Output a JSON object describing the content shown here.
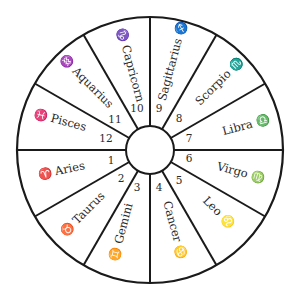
{
  "diagram": {
    "type": "zodiac-wheel",
    "center": [
      150,
      150
    ],
    "outer_radius": 133,
    "inner_radius": 24,
    "sector_count": 12,
    "line_color": "#1a1a1a",
    "text_color": "#2a2a2a",
    "sectors": [
      {
        "house": "1",
        "sign": "Aries",
        "symbol": "♈",
        "mid_angle": 165
      },
      {
        "house": "2",
        "sign": "Taurus",
        "symbol": "♉",
        "mid_angle": 135
      },
      {
        "house": "3",
        "sign": "Gemini",
        "symbol": "♊",
        "mid_angle": 105
      },
      {
        "house": "4",
        "sign": "Cancer",
        "symbol": "♋",
        "mid_angle": 75
      },
      {
        "house": "5",
        "sign": "Leo",
        "symbol": "♌",
        "mid_angle": 45
      },
      {
        "house": "6",
        "sign": "Virgo",
        "symbol": "♍",
        "mid_angle": 15
      },
      {
        "house": "7",
        "sign": "Libra",
        "symbol": "♎",
        "mid_angle": 345
      },
      {
        "house": "8",
        "sign": "Scorpio",
        "symbol": "♏",
        "mid_angle": 315
      },
      {
        "house": "9",
        "sign": "Sagittarius",
        "symbol": "♐",
        "mid_angle": 285
      },
      {
        "house": "10",
        "sign": "Capricorn",
        "symbol": "♑",
        "mid_angle": 255
      },
      {
        "house": "11",
        "sign": "Aquarius",
        "symbol": "♒",
        "mid_angle": 225
      },
      {
        "house": "12",
        "sign": "Pisces",
        "symbol": "♓",
        "mid_angle": 195
      }
    ]
  },
  "labels": {
    "s1": "♈ Aries",
    "s2": "♉ Taurus",
    "s3": "♊ Gemini",
    "s4": "Cancer ♋",
    "s5": "Leo ♌",
    "s6": "Virgo ♍",
    "s7": "Libra ♎",
    "s8": "Scorpio ♏",
    "s9": "Sagittarius ♐",
    "s10": "♑ Capricorn",
    "s11": "♒ Aquarius",
    "s12": "♓ Pisces",
    "n1": "1",
    "n2": "2",
    "n3": "3",
    "n4": "4",
    "n5": "5",
    "n6": "6",
    "n7": "7",
    "n8": "8",
    "n9": "9",
    "n10": "10",
    "n11": "11",
    "n12": "12"
  }
}
